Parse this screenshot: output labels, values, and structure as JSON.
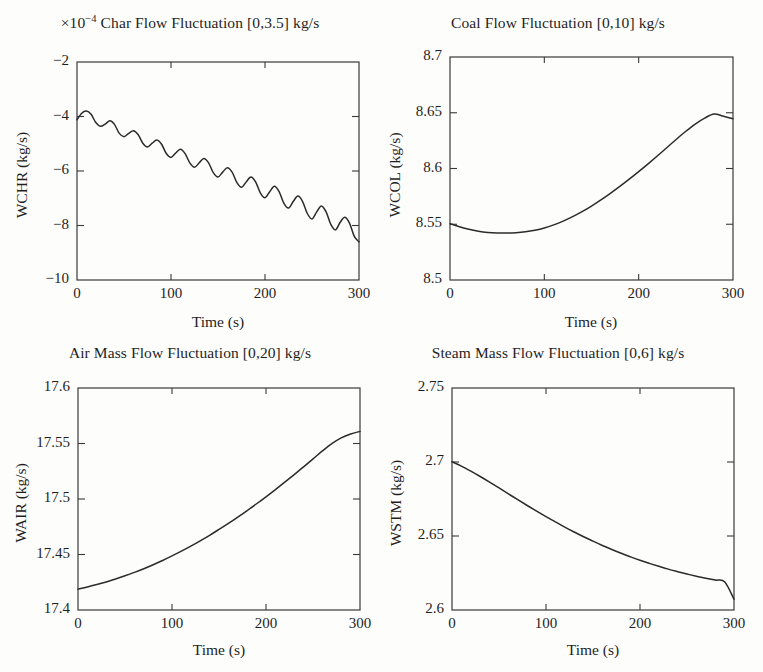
{
  "figure": {
    "background": "#fdfdfc",
    "line_color": "#2b2b2b",
    "axis_color": "#3a3a3a"
  },
  "chart_data": [
    {
      "id": "wchr",
      "type": "line",
      "title": "Char Flow Fluctuation [0,3.5] kg/s",
      "title_prefix": "×10",
      "title_exponent": "−4",
      "exponent_multiplier": 0.0001,
      "xlabel": "Time (s)",
      "ylabel": "WCHR (kg/s)",
      "xlim": [
        0,
        300
      ],
      "ylim": [
        -10,
        -2
      ],
      "xticks": [
        0,
        100,
        200,
        300
      ],
      "xticklabels": [
        "0",
        "100",
        "200",
        "300"
      ],
      "yticks": [
        -10,
        -8,
        -6,
        -4,
        -2
      ],
      "yticklabels": [
        "−10",
        "−8",
        "−6",
        "−4",
        "−2"
      ],
      "grid": false,
      "legend": "none",
      "series": [
        {
          "name": "WCHR",
          "description": "Decaying ramp from about -4.1e-4 to -8.6e-4 kg/s with a growing-amplitude oscillation of roughly 25 s period",
          "x": [
            0,
            5,
            10,
            15,
            20,
            25,
            30,
            35,
            40,
            45,
            50,
            55,
            60,
            65,
            70,
            75,
            80,
            85,
            90,
            95,
            100,
            105,
            110,
            115,
            120,
            125,
            130,
            135,
            140,
            145,
            150,
            155,
            160,
            165,
            170,
            175,
            180,
            185,
            190,
            195,
            200,
            205,
            210,
            215,
            220,
            225,
            230,
            235,
            240,
            245,
            250,
            255,
            260,
            265,
            270,
            275,
            280,
            285,
            290,
            295,
            300
          ],
          "y": [
            -4.12,
            -3.88,
            -3.8,
            -3.92,
            -4.22,
            -4.36,
            -4.28,
            -4.16,
            -4.3,
            -4.62,
            -4.74,
            -4.62,
            -4.52,
            -4.66,
            -4.98,
            -5.12,
            -4.98,
            -4.86,
            -5.02,
            -5.36,
            -5.5,
            -5.34,
            -5.2,
            -5.36,
            -5.7,
            -5.86,
            -5.7,
            -5.54,
            -5.7,
            -6.06,
            -6.22,
            -6.04,
            -5.88,
            -6.04,
            -6.42,
            -6.6,
            -6.4,
            -6.22,
            -6.4,
            -6.8,
            -6.98,
            -6.76,
            -6.56,
            -6.76,
            -7.18,
            -7.36,
            -7.12,
            -6.92,
            -7.12,
            -7.56,
            -7.76,
            -7.5,
            -7.28,
            -7.5,
            -7.96,
            -8.16,
            -7.88,
            -7.7,
            -7.92,
            -8.4,
            -8.6
          ]
        }
      ]
    },
    {
      "id": "wcol",
      "type": "line",
      "title": "Coal Flow Fluctuation [0,10] kg/s",
      "title_prefix": "",
      "title_exponent": "",
      "xlabel": "Time (s)",
      "ylabel": "WCOL (kg/s)",
      "xlim": [
        0,
        300
      ],
      "ylim": [
        8.5,
        8.7
      ],
      "xticks": [
        0,
        100,
        200,
        300
      ],
      "xticklabels": [
        "0",
        "100",
        "200",
        "300"
      ],
      "yticks": [
        8.5,
        8.55,
        8.6,
        8.65,
        8.7
      ],
      "yticklabels": [
        "8.5",
        "8.55",
        "8.6",
        "8.65",
        "8.7"
      ],
      "grid": false,
      "legend": "none",
      "series": [
        {
          "name": "WCOL",
          "description": "Shallow dip to about 8.542 kg/s near t = 60 s then smooth rise to about 8.645 kg/s at t = 300 s",
          "x": [
            0,
            10,
            20,
            30,
            40,
            50,
            60,
            70,
            80,
            90,
            100,
            110,
            120,
            130,
            140,
            150,
            160,
            170,
            180,
            190,
            200,
            210,
            220,
            230,
            240,
            250,
            260,
            270,
            280,
            290,
            300
          ],
          "y": [
            8.5505,
            8.5478,
            8.5455,
            8.5438,
            8.5427,
            8.5422,
            8.5421,
            8.5424,
            8.5432,
            8.5446,
            8.5466,
            8.5494,
            8.5528,
            8.5568,
            8.5613,
            8.5663,
            8.5718,
            8.5777,
            8.5839,
            8.5904,
            8.5972,
            8.6042,
            8.6114,
            8.6188,
            8.6262,
            8.6334,
            8.6399,
            8.6452,
            8.6489,
            8.6468,
            8.6447
          ]
        }
      ]
    },
    {
      "id": "wair",
      "type": "line",
      "title": "Air Mass Flow Fluctuation [0,20] kg/s",
      "title_prefix": "",
      "title_exponent": "",
      "xlabel": "Time (s)",
      "ylabel": "WAIR (kg/s)",
      "xlim": [
        0,
        300
      ],
      "ylim": [
        17.4,
        17.6
      ],
      "xticks": [
        0,
        100,
        200,
        300
      ],
      "xticklabels": [
        "0",
        "100",
        "200",
        "300"
      ],
      "yticks": [
        17.4,
        17.45,
        17.5,
        17.55,
        17.6
      ],
      "yticklabels": [
        "17.4",
        "17.45",
        "17.5",
        "17.55",
        "17.6"
      ],
      "grid": false,
      "legend": "none",
      "series": [
        {
          "name": "WAIR",
          "description": "Monotonic accelerating rise from about 17.419 kg/s to about 17.561 kg/s",
          "x": [
            0,
            10,
            20,
            30,
            40,
            50,
            60,
            70,
            80,
            90,
            100,
            110,
            120,
            130,
            140,
            150,
            160,
            170,
            180,
            190,
            200,
            210,
            220,
            230,
            240,
            250,
            260,
            270,
            280,
            290,
            300
          ],
          "y": [
            17.4188,
            17.4207,
            17.4229,
            17.4253,
            17.4279,
            17.4308,
            17.4339,
            17.4372,
            17.4408,
            17.4446,
            17.4487,
            17.453,
            17.4575,
            17.4623,
            17.4673,
            17.4726,
            17.478,
            17.4837,
            17.4896,
            17.4957,
            17.502,
            17.5085,
            17.5152,
            17.522,
            17.529,
            17.5361,
            17.5433,
            17.5499,
            17.5551,
            17.5586,
            17.5609
          ]
        }
      ]
    },
    {
      "id": "wstm",
      "type": "line",
      "title": "Steam Mass Flow Fluctuation [0,6] kg/s",
      "title_prefix": "",
      "title_exponent": "",
      "xlabel": "Time (s)",
      "ylabel": "WSTM (kg/s)",
      "xlim": [
        0,
        300
      ],
      "ylim": [
        2.6,
        2.75
      ],
      "xticks": [
        0,
        100,
        200,
        300
      ],
      "xticklabels": [
        "0",
        "100",
        "200",
        "300"
      ],
      "yticks": [
        2.6,
        2.65,
        2.7,
        2.75
      ],
      "yticklabels": [
        "2.6",
        "2.65",
        "2.7",
        "2.75"
      ],
      "grid": false,
      "legend": "none",
      "series": [
        {
          "name": "WSTM",
          "description": "Exponential-like decay from 2.700 kg/s to about 2.607 kg/s",
          "x": [
            0,
            10,
            20,
            30,
            40,
            50,
            60,
            70,
            80,
            90,
            100,
            110,
            120,
            130,
            140,
            150,
            160,
            170,
            180,
            190,
            200,
            210,
            220,
            230,
            240,
            250,
            260,
            270,
            280,
            290,
            300
          ],
          "y": [
            2.7002,
            2.6972,
            2.6938,
            2.6902,
            2.6864,
            2.6825,
            2.6785,
            2.6745,
            2.6706,
            2.6668,
            2.6631,
            2.6595,
            2.656,
            2.6527,
            2.6495,
            2.6465,
            2.6436,
            2.6409,
            2.6383,
            2.6359,
            2.6336,
            2.6315,
            2.6295,
            2.6276,
            2.6259,
            2.6243,
            2.6228,
            2.6214,
            2.6202,
            2.6191,
            2.6073
          ]
        }
      ]
    }
  ]
}
